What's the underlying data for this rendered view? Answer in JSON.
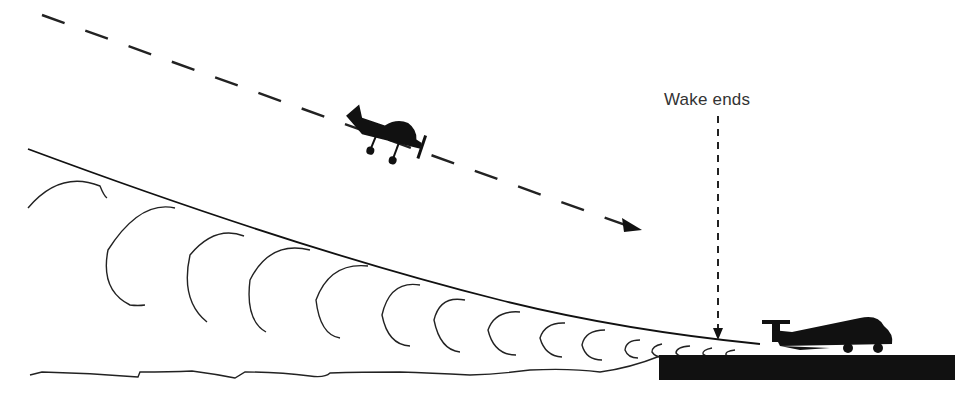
{
  "diagram": {
    "labels": {
      "wake_ends": "Wake ends"
    },
    "elements": [
      {
        "id": "approach-path",
        "type": "dashed-arrow",
        "description": "Descending flight path of approaching aircraft"
      },
      {
        "id": "approaching-aircraft",
        "type": "silhouette",
        "description": "Small aircraft on approach"
      },
      {
        "id": "glide-path-line",
        "type": "line",
        "description": "Glide path of preceding aircraft"
      },
      {
        "id": "wake-vortices",
        "type": "curls",
        "description": "Wake vortex curls descending behind preceding aircraft"
      },
      {
        "id": "wake-ends-arrow",
        "type": "dashed-arrow",
        "description": "Points to where wake ends at touchdown"
      },
      {
        "id": "landed-aircraft",
        "type": "silhouette",
        "description": "Aircraft on runway after touchdown"
      },
      {
        "id": "runway",
        "type": "block",
        "description": "Runway surface"
      },
      {
        "id": "ground-line",
        "type": "wavy-line",
        "description": "Terrain before runway"
      }
    ],
    "colors": {
      "ink": "#111111",
      "background": "#ffffff"
    }
  }
}
